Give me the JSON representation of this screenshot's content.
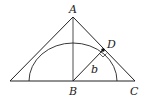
{
  "diagram": {
    "type": "geometry",
    "labels": {
      "A": "A",
      "B": "B",
      "C": "C",
      "D": "D",
      "b": "b"
    },
    "points": {
      "A": [
        73,
        17
      ],
      "B": [
        73,
        81
      ],
      "C": [
        135,
        81
      ],
      "left_base": [
        10,
        81
      ],
      "D": [
        103,
        50
      ]
    },
    "elements": [
      "triangle with apex A and base through B to C",
      "altitude AB",
      "semicircle centered at B",
      "segment BD of length b perpendicular to AC at D"
    ],
    "colors": {
      "stroke": "#222222",
      "background": "#ffffff"
    }
  }
}
